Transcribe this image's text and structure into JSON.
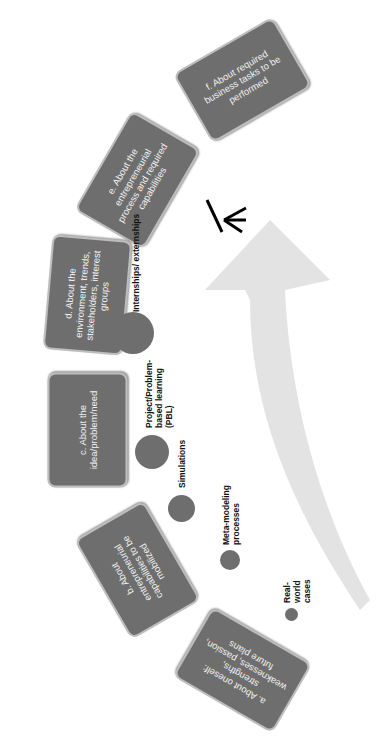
{
  "diagram": {
    "rotation_deg": -90,
    "boxes": [
      {
        "id": "a",
        "label": "a. About oneself: strengths, weaknesses, passion, future plans"
      },
      {
        "id": "b",
        "label": "b. About entrepreneurial capabilities to be mobilized"
      },
      {
        "id": "c",
        "label": "c. About the idea/problem/need"
      },
      {
        "id": "d",
        "label": "d. About the environment, trends, stakeholders, interest groups"
      },
      {
        "id": "e",
        "label": "e. About the entrepreneurial process and required capabilities"
      },
      {
        "id": "f",
        "label": "f. About required business tasks to be performed"
      }
    ],
    "methods": [
      {
        "label": "Real-world cases",
        "size": "smallest"
      },
      {
        "label": "Meta-modeling processes",
        "size": "small"
      },
      {
        "label": "Simulations",
        "size": "medium"
      },
      {
        "label": "Project/Problem-based learning (PBL)",
        "size": "large"
      },
      {
        "label": "Internships/ externships",
        "size": "largest"
      }
    ],
    "arrow": {
      "color": "#e3e3e3",
      "direction": "upward curve"
    },
    "icon": "person-figure-icon",
    "colors": {
      "box_fill": "#6e6e6e",
      "box_border": "#bdbdbd",
      "box_text": "#f2f2f2",
      "circle_fill": "#6e6e6e"
    }
  }
}
